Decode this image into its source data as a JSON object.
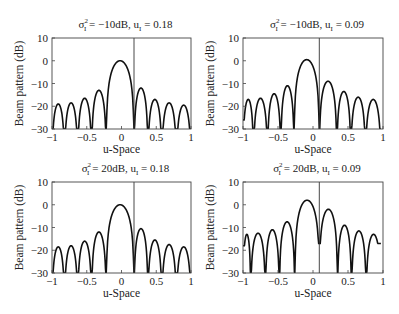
{
  "figure": {
    "width": 399,
    "height": 314,
    "line_color": "#111111",
    "marker_color": "#333333",
    "axis_color": "#444444"
  },
  "chart_data": [
    {
      "type": "line",
      "title": "σ²_I = −10dB, u_I = 0.18",
      "title_parts": {
        "sigma": "σ",
        "sup": "2",
        "sub": "I",
        "mid": " = −10dB, u",
        "usub": "I",
        "tail": " = 0.18"
      },
      "xlabel": "u-Space",
      "ylabel": "Beam pattern (dB)",
      "xlim": [
        -1,
        1
      ],
      "ylim": [
        -30,
        10
      ],
      "xticks": [
        -1,
        -0.5,
        0,
        0.5,
        1
      ],
      "xtick_labels": [
        "−1",
        "−0.5",
        "0",
        "0.5",
        "1"
      ],
      "yticks": [
        10,
        0,
        -10,
        -20,
        -30
      ],
      "ytick_labels": [
        "10",
        "0",
        "−10",
        "−20",
        "−30"
      ],
      "interferer_u": 0.18,
      "box": {
        "x0": 52,
        "x1": 191,
        "y0": 38,
        "y1": 129
      },
      "nulls": [
        -1.0,
        -0.82,
        -0.63,
        -0.43,
        -0.22,
        0.18,
        0.38,
        0.58,
        0.79,
        1.0
      ],
      "peaks": [
        -19,
        -18.5,
        -16.5,
        -13,
        0,
        -12,
        -17,
        -18.5,
        -19.5
      ],
      "start_level": -30,
      "end_level": -30
    },
    {
      "type": "line",
      "title": "σ²_I = −10dB, u_I = 0.09",
      "title_parts": {
        "sigma": "σ",
        "sup": "2",
        "sub": "I",
        "mid": " = −10dB, u",
        "usub": "I",
        "tail": " = 0.09"
      },
      "xlabel": "u-Space",
      "ylabel": "Beam pattern (dB)",
      "xlim": [
        -1,
        1
      ],
      "ylim": [
        -30,
        10
      ],
      "xticks": [
        -1,
        -0.5,
        0,
        0.5,
        1
      ],
      "xtick_labels": [
        "−1",
        "−0.5",
        "0",
        "0.5",
        "1"
      ],
      "yticks": [
        10,
        0,
        -10,
        -20,
        -30
      ],
      "ytick_labels": [
        "10",
        "0",
        "−10",
        "−20",
        "−30"
      ],
      "interferer_u": 0.09,
      "box": {
        "x0": 243,
        "x1": 383,
        "y0": 38,
        "y1": 129
      },
      "nulls": [
        -1.0,
        -0.85,
        -0.65,
        -0.46,
        -0.27,
        0.09,
        0.34,
        0.54,
        0.75,
        0.97
      ],
      "peaks": [
        -17,
        -16.5,
        -14.5,
        -11,
        0.5,
        -9,
        -13.5,
        -16,
        -17
      ],
      "start_level": -26,
      "end_level": -30
    },
    {
      "type": "line",
      "title": "σ²_I = 20dB, u_I = 0.18",
      "title_parts": {
        "sigma": "σ",
        "sup": "2",
        "sub": "I",
        "mid": " = 20dB, u",
        "usub": "I",
        "tail": " = 0.18"
      },
      "xlabel": "u-Space",
      "ylabel": "Beam pattern (dB)",
      "xlim": [
        -1,
        1
      ],
      "ylim": [
        -30,
        10
      ],
      "xticks": [
        -1,
        -0.5,
        0,
        0.5,
        1
      ],
      "xtick_labels": [
        "−1",
        "−0.5",
        "0",
        "0.5",
        "1"
      ],
      "yticks": [
        10,
        0,
        -10,
        -20,
        -30
      ],
      "ytick_labels": [
        "10",
        "0",
        "−10",
        "−20",
        "−30"
      ],
      "interferer_u": 0.18,
      "box": {
        "x0": 52,
        "x1": 191,
        "y0": 182,
        "y1": 273
      },
      "nulls": [
        -1.0,
        -0.82,
        -0.63,
        -0.43,
        -0.22,
        0.18,
        0.38,
        0.58,
        0.79,
        1.0
      ],
      "peaks": [
        -18.5,
        -18,
        -16,
        -12,
        0,
        -10.5,
        -15.5,
        -17.5,
        -18.5
      ],
      "start_level": -30,
      "end_level": -30
    },
    {
      "type": "line",
      "title": "σ²_I = 20dB, u_I = 0.09",
      "title_parts": {
        "sigma": "σ",
        "sup": "2",
        "sub": "I",
        "mid": " = 20dB, u",
        "usub": "I",
        "tail": " = 0.09"
      },
      "xlabel": "u-Space",
      "ylabel": "Beam pattern (dB)",
      "xlim": [
        -1,
        1
      ],
      "ylim": [
        -30,
        10
      ],
      "xticks": [
        -1,
        -0.5,
        0,
        0.5,
        1
      ],
      "xtick_labels": [
        "−1",
        "−0.5",
        "0",
        "0.5",
        "1"
      ],
      "yticks": [
        10,
        0,
        -10,
        -20,
        -30
      ],
      "ytick_labels": [
        "10",
        "0",
        "−10",
        "−20",
        "−30"
      ],
      "interferer_u": 0.09,
      "box": {
        "x0": 243,
        "x1": 383,
        "y0": 182,
        "y1": 273
      },
      "nulls": [
        -1.0,
        -0.89,
        -0.68,
        -0.48,
        -0.26,
        0.09,
        0.35,
        0.55,
        0.76,
        0.97
      ],
      "peaks": [
        -13,
        -12.5,
        -11,
        -7.5,
        2,
        -2,
        -9,
        -11.5,
        -13
      ],
      "start_level": -18,
      "end_level": -17,
      "notch_levels": {
        "0.09": -17
      }
    }
  ]
}
